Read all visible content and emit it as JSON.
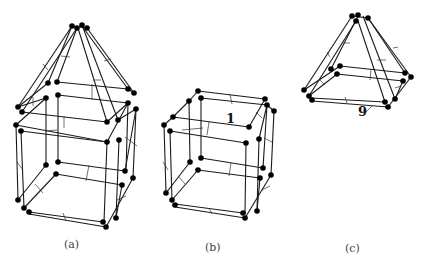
{
  "figure": {
    "panels": [
      {
        "id": "a",
        "caption": "(a)",
        "description": "cube with pyramid on top"
      },
      {
        "id": "b",
        "caption": "(b)",
        "description": "cube",
        "annotation": "1"
      },
      {
        "id": "c",
        "caption": "(c)",
        "description": "pyramid",
        "annotation": "9"
      }
    ],
    "colors": {
      "edge": "#1a1a1a",
      "node": "#000000",
      "caption": "#444444"
    }
  }
}
